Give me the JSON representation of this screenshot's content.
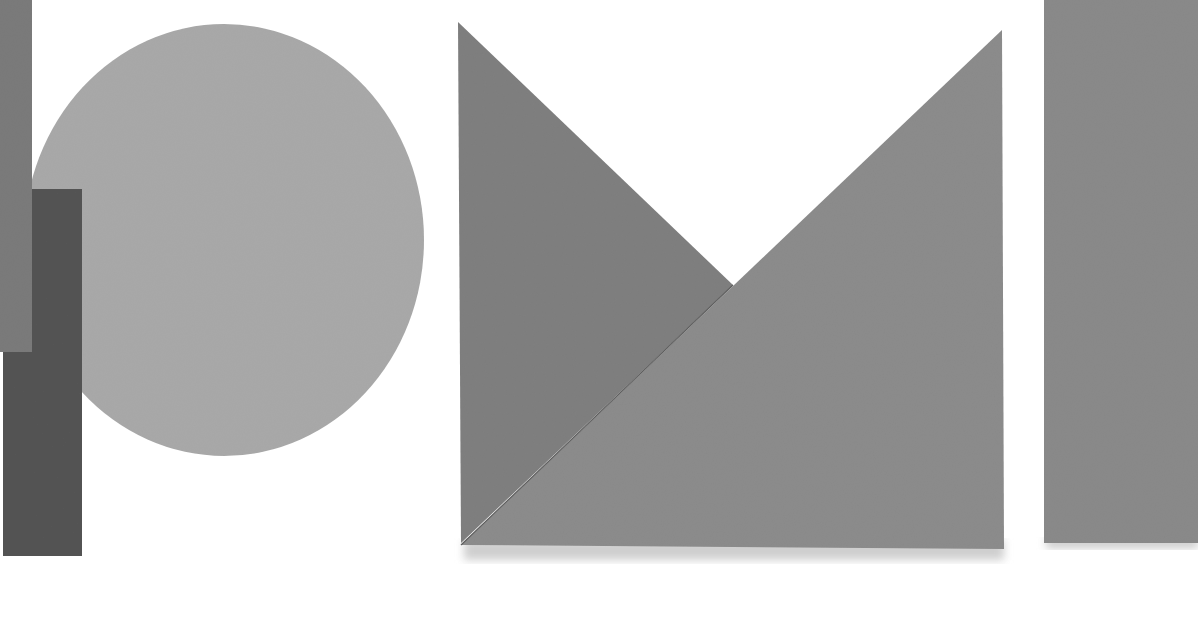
{
  "scene": {
    "description": "Photograph of grayscale paper cutout geometric shapes on white background",
    "background": "#ffffff",
    "shapes": [
      {
        "name": "circle",
        "color": "#a9a9a9"
      },
      {
        "name": "tall-gray-rectangle",
        "color": "#7b7b7b"
      },
      {
        "name": "dark-rectangle",
        "color": "#545454"
      },
      {
        "name": "left-triangle",
        "color": "#7f7f7f"
      },
      {
        "name": "right-triangle",
        "color": "#8c8c8c"
      },
      {
        "name": "right-strip",
        "color": "#8a8a8a"
      }
    ]
  }
}
